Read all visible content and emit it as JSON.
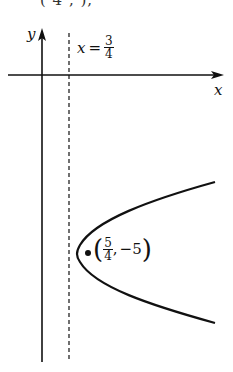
{
  "figure": {
    "top_fragment": "( 4 ,    ),",
    "axes": {
      "x_label": "x",
      "y_label": "y"
    },
    "directrix": {
      "label_var": "x",
      "label_eq": "=",
      "numerator": "3",
      "denominator": "4"
    },
    "vertex": {
      "numerator": "5",
      "denominator": "4",
      "comma": ",",
      "y_value": "−5",
      "open_paren": "(",
      "close_paren": ")"
    },
    "colors": {
      "ink": "#111111",
      "background": "#ffffff"
    }
  }
}
